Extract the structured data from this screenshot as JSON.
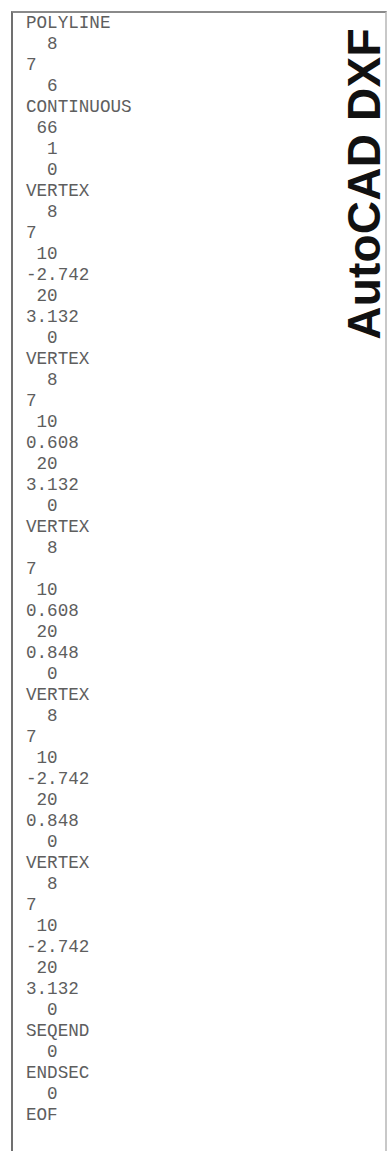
{
  "title": "AutoCAD DXF",
  "code_lines": [
    "POLYLINE",
    "  8",
    "7",
    "  6",
    "CONTINUOUS",
    " 66",
    "  1",
    "  0",
    "VERTEX",
    "  8",
    "7",
    " 10",
    "-2.742",
    " 20",
    "3.132",
    "  0",
    "VERTEX",
    "  8",
    "7",
    " 10",
    "0.608",
    " 20",
    "3.132",
    "  0",
    "VERTEX",
    "  8",
    "7",
    " 10",
    "0.608",
    " 20",
    "0.848",
    "  0",
    "VERTEX",
    "  8",
    "7",
    " 10",
    "-2.742",
    " 20",
    "0.848",
    "  0",
    "VERTEX",
    "  8",
    "7",
    " 10",
    "-2.742",
    " 20",
    "3.132",
    "  0",
    "SEQEND",
    "  0",
    "ENDSEC",
    "  0",
    "EOF"
  ]
}
